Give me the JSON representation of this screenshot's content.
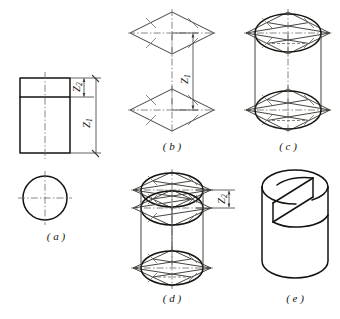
{
  "figure": {
    "background_color": "#ffffff",
    "ink_color": "#15130f",
    "thin_color": "#5d5b57",
    "center_line_color": "#6b6965",
    "panels": [
      {
        "id": "a",
        "caption": "( a )",
        "description": "Orthographic two-view drawing: front rectangle with slot line and top circle",
        "dimensions": [
          {
            "name": "Z2",
            "letter": "Z",
            "subscript": "2",
            "orientation": "vertical-rotated"
          },
          {
            "name": "Z1",
            "letter": "Z",
            "subscript": "1",
            "orientation": "vertical-rotated"
          }
        ]
      },
      {
        "id": "b",
        "caption": "( b )",
        "description": "Two isometric rhombi (top and bottom faces) separated by height Z1",
        "dimensions": [
          {
            "name": "Z1",
            "letter": "Z",
            "subscript": "1",
            "orientation": "vertical-rotated"
          }
        ]
      },
      {
        "id": "c",
        "caption": "( c )",
        "description": "Four-centre ellipses inscribed in the rhombi with construction lines",
        "dimensions": []
      },
      {
        "id": "d",
        "caption": "( d )",
        "description": "Three ellipse planes showing the inclined cut, offset by Z2",
        "dimensions": [
          {
            "name": "Z2",
            "letter": "Z",
            "subscript": "2",
            "orientation": "vertical-rotated"
          }
        ]
      },
      {
        "id": "e",
        "caption": "( e )",
        "description": "Finished isometric solid: cylinder with an inclined slot",
        "dimensions": []
      }
    ]
  }
}
